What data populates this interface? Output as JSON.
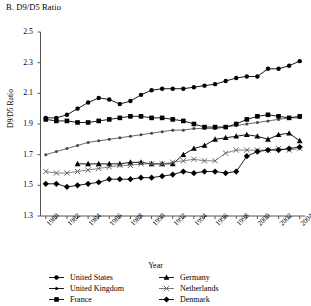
{
  "panel": {
    "title": "B. D9/D5 Ratio"
  },
  "axes": {
    "ylabel": "D9/D5 Ratio",
    "xlabel": "Year",
    "ytick_labels": [
      "2.5",
      "2.3",
      "2.1",
      "1.9",
      "1.7",
      "1.5",
      "1.3"
    ],
    "xtick_labels": [
      "1980",
      "1982",
      "1984",
      "1986",
      "1988",
      "1990",
      "1992",
      "1994",
      "1996",
      "1998",
      "2000",
      "2002",
      "2004"
    ]
  },
  "legend": {
    "items": [
      {
        "label": "United States",
        "marker": "circle-small",
        "color": "#000000"
      },
      {
        "label": "United Kingdom",
        "marker": "dot-line",
        "color": "#000000"
      },
      {
        "label": "France",
        "marker": "square",
        "color": "#000000"
      },
      {
        "label": "Germany",
        "marker": "triangle",
        "color": "#000000"
      },
      {
        "label": "Netherlands",
        "marker": "cross",
        "color": "#666666"
      },
      {
        "label": "Denmark",
        "marker": "diamond",
        "color": "#000000"
      }
    ]
  },
  "chart_data": {
    "type": "line",
    "title": "B. D9/D5 Ratio",
    "xlabel": "Year",
    "ylabel": "D9/D5 Ratio",
    "xlim": [
      1979.5,
      2004.5
    ],
    "ylim": [
      1.3,
      2.5
    ],
    "ytick_step": 0.2,
    "grid": false,
    "legend_position": "bottom",
    "x": [
      1980,
      1981,
      1982,
      1983,
      1984,
      1985,
      1986,
      1987,
      1988,
      1989,
      1990,
      1991,
      1992,
      1993,
      1994,
      1995,
      1996,
      1997,
      1998,
      1999,
      2000,
      2001,
      2002,
      2003,
      2004
    ],
    "series": [
      {
        "name": "United States",
        "marker": "circle-small",
        "color": "#000000",
        "values": [
          1.94,
          1.94,
          1.96,
          2.0,
          2.04,
          2.07,
          2.06,
          2.03,
          2.05,
          2.09,
          2.12,
          2.13,
          2.13,
          2.13,
          2.14,
          2.15,
          2.16,
          2.18,
          2.2,
          2.21,
          2.21,
          2.26,
          2.26,
          2.28,
          2.31
        ]
      },
      {
        "name": "United Kingdom",
        "marker": "dot-line",
        "color": "#444444",
        "values": [
          1.7,
          1.72,
          1.74,
          1.76,
          1.78,
          1.79,
          1.8,
          1.81,
          1.82,
          1.83,
          1.84,
          1.85,
          1.86,
          1.86,
          1.87,
          1.87,
          1.87,
          1.88,
          1.89,
          1.9,
          1.91,
          1.92,
          1.93,
          1.94,
          1.94
        ]
      },
      {
        "name": "France",
        "marker": "square",
        "color": "#000000",
        "values": [
          1.93,
          1.92,
          1.92,
          1.91,
          1.91,
          1.92,
          1.93,
          1.94,
          1.95,
          1.95,
          1.94,
          1.94,
          1.93,
          1.92,
          1.9,
          1.88,
          1.88,
          1.88,
          1.9,
          1.93,
          1.95,
          1.96,
          1.95,
          1.94,
          1.95
        ]
      },
      {
        "name": "Germany",
        "marker": "triangle",
        "color": "#000000",
        "values": [
          null,
          null,
          null,
          1.64,
          1.64,
          1.64,
          1.64,
          1.64,
          1.65,
          1.65,
          1.64,
          1.64,
          1.64,
          1.7,
          1.74,
          1.76,
          1.8,
          1.81,
          1.82,
          1.83,
          1.82,
          1.8,
          1.83,
          1.84,
          1.79
        ]
      },
      {
        "name": "Netherlands",
        "marker": "cross",
        "color": "#666666",
        "values": [
          1.59,
          1.58,
          1.58,
          1.59,
          1.6,
          1.61,
          1.62,
          1.63,
          1.63,
          1.64,
          1.64,
          1.64,
          1.65,
          1.66,
          1.67,
          1.66,
          1.66,
          1.71,
          1.73,
          1.73,
          1.73,
          1.73,
          1.74,
          1.73,
          1.74
        ]
      },
      {
        "name": "Denmark",
        "marker": "diamond",
        "color": "#000000",
        "values": [
          1.51,
          1.51,
          1.49,
          1.5,
          1.51,
          1.52,
          1.54,
          1.54,
          1.54,
          1.55,
          1.55,
          1.56,
          1.57,
          1.59,
          1.58,
          1.59,
          1.59,
          1.58,
          1.59,
          1.69,
          1.72,
          1.73,
          1.73,
          1.74,
          1.75
        ]
      }
    ]
  }
}
